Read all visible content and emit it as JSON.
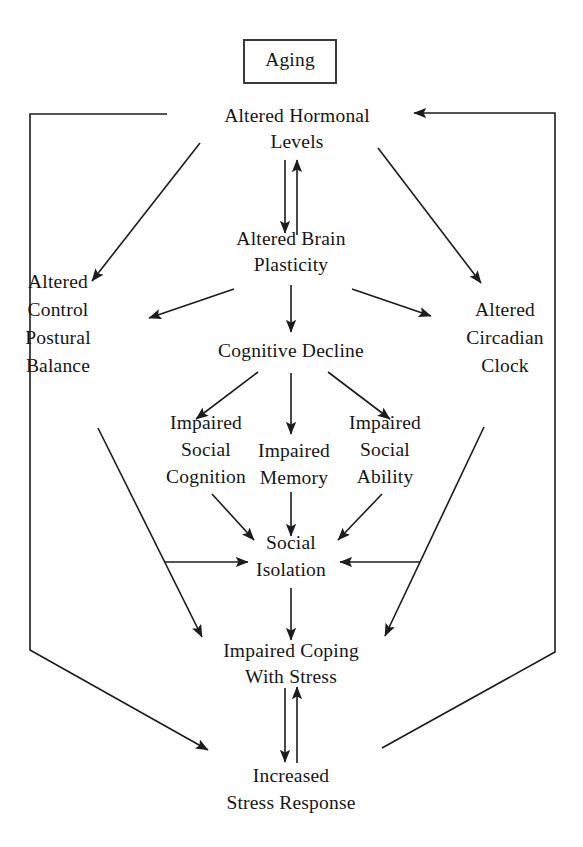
{
  "diagram": {
    "background_color": "#ffffff",
    "line_color": "#1c1c1c",
    "text_color": "#161616",
    "boxed_node": {
      "id": "aging",
      "label": "Aging",
      "x": 290,
      "y": 62,
      "box": {
        "x": 244,
        "y": 40,
        "width": 92,
        "height": 43
      }
    },
    "nodes": [
      {
        "id": "altered-hormonal-levels",
        "lines": [
          "Altered Hormonal",
          "Levels"
        ],
        "x": 297,
        "y": 131,
        "line_height": 26
      },
      {
        "id": "altered-brain-plasticity",
        "lines": [
          "Altered Brain",
          "Plasticity"
        ],
        "x": 291,
        "y": 254,
        "line_height": 26
      },
      {
        "id": "cognitive-decline",
        "lines": [
          "Cognitive Decline"
        ],
        "x": 291,
        "y": 353,
        "line_height": 26
      },
      {
        "id": "altered-control-postural-balance",
        "lines": [
          "Altered",
          "Control",
          "Postural",
          "Balance"
        ],
        "x": 58,
        "y": 326,
        "line_height": 28
      },
      {
        "id": "altered-circadian-clock",
        "lines": [
          "Altered",
          "Circadian",
          "Clock"
        ],
        "x": 505,
        "y": 340,
        "line_height": 28
      },
      {
        "id": "impaired-social-cognition",
        "lines": [
          "Impaired",
          "Social",
          "Cognition"
        ],
        "x": 206,
        "y": 452,
        "line_height": 27
      },
      {
        "id": "impaired-memory",
        "lines": [
          "Impaired",
          "Memory"
        ],
        "x": 294,
        "y": 466,
        "line_height": 27
      },
      {
        "id": "impaired-social-ability",
        "lines": [
          "Impaired",
          "Social",
          "Ability"
        ],
        "x": 385,
        "y": 452,
        "line_height": 27
      },
      {
        "id": "social-isolation",
        "lines": [
          "Social",
          "Isolation"
        ],
        "x": 291,
        "y": 558,
        "line_height": 27
      },
      {
        "id": "impaired-coping-with-stress",
        "lines": [
          "Impaired Coping",
          "With Stress"
        ],
        "x": 291,
        "y": 666,
        "line_height": 26
      },
      {
        "id": "increased-stress-response",
        "lines": [
          "Increased",
          "Stress Response"
        ],
        "x": 291,
        "y": 791,
        "line_height": 27
      }
    ],
    "edges": [
      {
        "id": "hormonal-to-plasticity",
        "from": "altered-hormonal-levels",
        "to": "altered-brain-plasticity",
        "path": "M 285 160 L 285 233",
        "arrow_end": true
      },
      {
        "id": "plasticity-to-hormonal",
        "from": "altered-brain-plasticity",
        "to": "altered-hormonal-levels",
        "path": "M 297 235 L 297 160",
        "arrow_end": true
      },
      {
        "id": "hormonal-to-postural",
        "from": "altered-hormonal-levels",
        "to": "altered-control-postural-balance",
        "path": "M 200 143 L 92 281",
        "arrow_end": true
      },
      {
        "id": "hormonal-to-circadian",
        "from": "altered-hormonal-levels",
        "to": "altered-circadian-clock",
        "path": "M 378 148 L 481 283",
        "arrow_end": true
      },
      {
        "id": "plasticity-to-postural",
        "from": "altered-brain-plasticity",
        "to": "altered-control-postural-balance",
        "path": "M 234 289 L 149 318",
        "arrow_end": true
      },
      {
        "id": "plasticity-to-circadian",
        "from": "altered-brain-plasticity",
        "to": "altered-circadian-clock",
        "path": "M 352 289 L 431 316",
        "arrow_end": true
      },
      {
        "id": "plasticity-to-cognitive-decline",
        "from": "altered-brain-plasticity",
        "to": "cognitive-decline",
        "path": "M 291 285 L 291 332",
        "arrow_end": true
      },
      {
        "id": "cognitive-to-social-cognition",
        "from": "cognitive-decline",
        "to": "impaired-social-cognition",
        "path": "M 258 372 L 196 419",
        "arrow_end": true
      },
      {
        "id": "cognitive-to-memory",
        "from": "cognitive-decline",
        "to": "impaired-memory",
        "path": "M 291 373 L 291 434",
        "arrow_end": true
      },
      {
        "id": "cognitive-to-social-ability",
        "from": "cognitive-decline",
        "to": "impaired-social-ability",
        "path": "M 328 372 L 390 419",
        "arrow_end": true
      },
      {
        "id": "social-cognition-to-isolation",
        "from": "impaired-social-cognition",
        "to": "social-isolation",
        "path": "M 212 494 L 254 540",
        "arrow_end": true
      },
      {
        "id": "memory-to-isolation",
        "from": "impaired-memory",
        "to": "social-isolation",
        "path": "M 291 492 L 291 536",
        "arrow_end": true
      },
      {
        "id": "social-ability-to-isolation",
        "from": "impaired-social-ability",
        "to": "social-isolation",
        "path": "M 382 494 L 338 540",
        "arrow_end": true
      },
      {
        "id": "postural-to-isolation",
        "from": "altered-control-postural-balance",
        "to": "social-isolation",
        "path": "M 165 562 L 248 562",
        "arrow_end": true
      },
      {
        "id": "circadian-to-isolation",
        "from": "altered-circadian-clock",
        "to": "social-isolation",
        "path": "M 420 562 L 340 562",
        "arrow_end": true
      },
      {
        "id": "postural-to-coping",
        "from": "altered-control-postural-balance",
        "to": "impaired-coping-with-stress",
        "path": "M 98 428 L 202 637",
        "arrow_end": true
      },
      {
        "id": "circadian-to-coping",
        "from": "altered-circadian-clock",
        "to": "impaired-coping-with-stress",
        "path": "M 484 427 L 385 636",
        "arrow_end": true
      },
      {
        "id": "isolation-to-coping",
        "from": "social-isolation",
        "to": "impaired-coping-with-stress",
        "path": "M 291 588 L 291 640",
        "arrow_end": true
      },
      {
        "id": "coping-to-stress-response",
        "from": "impaired-coping-with-stress",
        "to": "increased-stress-response",
        "path": "M 285 688 L 285 762",
        "arrow_end": true
      },
      {
        "id": "stress-response-to-coping",
        "from": "increased-stress-response",
        "to": "impaired-coping-with-stress",
        "path": "M 297 763 L 297 687",
        "arrow_end": true
      },
      {
        "id": "feedback-left-outer",
        "from": "increased-stress-response",
        "to": "altered-hormonal-levels",
        "path": "M 208 750 L 30 650 L 30 114 L 167 114",
        "arrow_end": false,
        "arrow_start": true
      },
      {
        "id": "feedback-right-outer",
        "from": "increased-stress-response",
        "to": "altered-hormonal-levels",
        "path": "M 382 748 L 555 652 L 555 113 L 414 113",
        "arrow_end": true
      }
    ]
  }
}
